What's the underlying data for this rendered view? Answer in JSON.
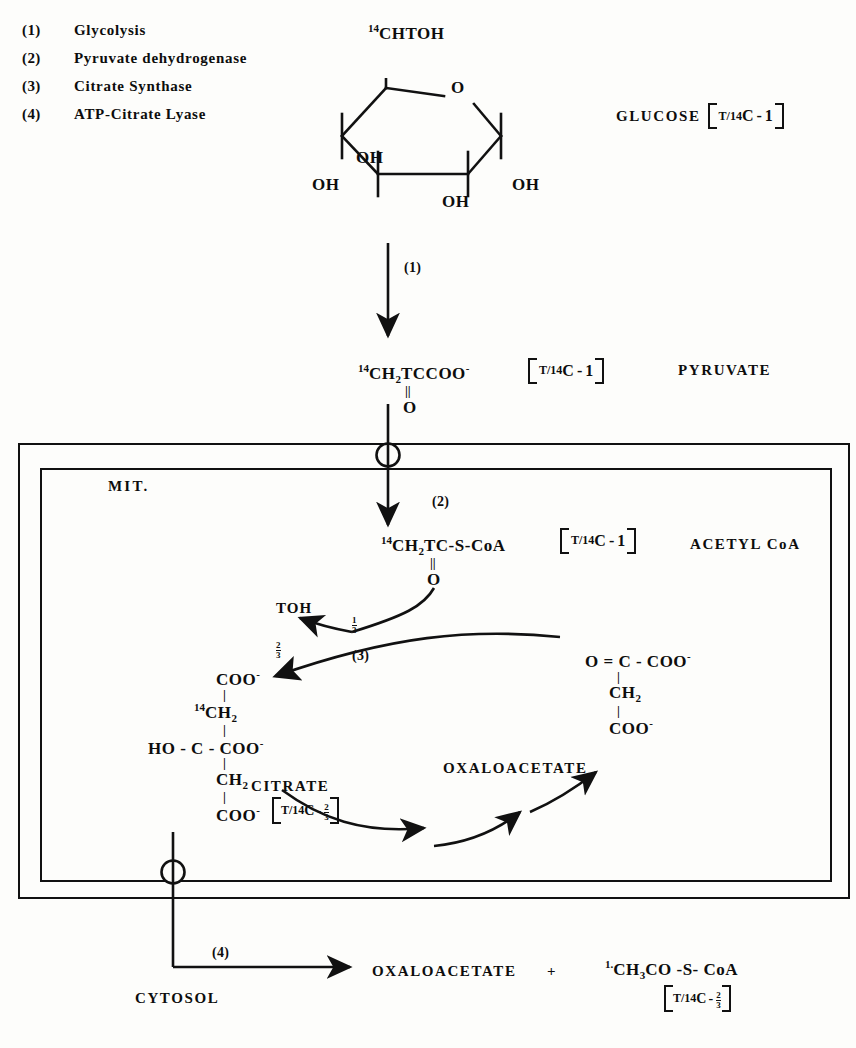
{
  "legend": {
    "items": [
      {
        "num": "(1)",
        "label": "Glycolysis"
      },
      {
        "num": "(2)",
        "label": "Pyruvate dehydrogenase"
      },
      {
        "num": "(3)",
        "label": "Citrate Synthase"
      },
      {
        "num": "(4)",
        "label": "ATP-Citrate Lyase"
      }
    ]
  },
  "glucose": {
    "top_carbon": {
      "sup": "14",
      "text": "CHTOH"
    },
    "ring_oxygen": "O",
    "hydroxyls": [
      "OH",
      "OH",
      "OH",
      "OH"
    ],
    "name": "GLUCOSE",
    "isotope": {
      "sup": "T/14",
      "main": "C",
      "dash": "-",
      "position": "1"
    }
  },
  "steps": {
    "glycolysis": "(1)",
    "pyruvate_dehydrogenase": "(2)",
    "citrate_synthase": "(3)",
    "atp_citrate_lyase": "(4)"
  },
  "pyruvate": {
    "formula_sup": "14",
    "formula": "CH",
    "formula_sub": "2",
    "formula_rest": "TCCOO",
    "charge": "-",
    "double_bond": "||",
    "carbonyl_o": "O",
    "isotope": {
      "sup": "T/14",
      "main": "C",
      "dash": "-",
      "position": "1"
    },
    "name": "PYRUVATE"
  },
  "mitochondrion": {
    "label": "MIT."
  },
  "acetyl_coa_mito": {
    "formula_sup": "14",
    "formula": "CH",
    "formula_sub": "2",
    "formula_rest": "TC-S-CoA",
    "double_bond": "||",
    "carbonyl_o": "O",
    "isotope": {
      "sup": "T/14",
      "main": "C",
      "dash": "-",
      "position": "1"
    },
    "name": "ACETYL CoA"
  },
  "citrate_synthase_reaction": {
    "toh": "TOH",
    "fraction_one_third": {
      "num": "1",
      "den": "3"
    },
    "fraction_two_thirds": {
      "num": "2",
      "den": "3"
    },
    "step": "(3)"
  },
  "citrate": {
    "lines": [
      "COO",
      "CH",
      "HO - C - COO",
      "CH",
      "COO"
    ],
    "carbon14_sup": "14",
    "name": "CITRATE",
    "isotope": {
      "sup": "T/14",
      "main": "C",
      "dash": "-",
      "num": "2",
      "den": "3"
    }
  },
  "oxaloacetate_mito": {
    "line1": "O = C - COO",
    "line2": "CH",
    "line2_sub": "2",
    "line3": "COO",
    "charge": "-",
    "name": "OXALOACETATE"
  },
  "cytosol": {
    "label": "CYTOSOL",
    "step": "(4)",
    "product1": "OXALOACETATE",
    "plus": "+",
    "product2_sup": "1.",
    "product2": "CH",
    "product2_sub": "3",
    "product2_rest": "CO -S- CoA",
    "isotope": {
      "sup": "T/14",
      "main": "C",
      "dash": "-",
      "num": "2",
      "den": "3"
    }
  },
  "colors": {
    "ink": "#0d0d0d",
    "paper": "#fdfdfb"
  }
}
